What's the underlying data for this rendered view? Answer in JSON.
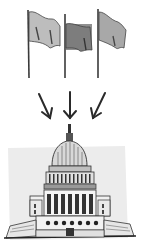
{
  "illustration": {
    "description": "Three flags with arrows pointing down to the U.S. Capitol building",
    "flags": [
      {
        "name": "flag-left",
        "x": 28,
        "shade": "#bdbdbd"
      },
      {
        "name": "flag-center",
        "x": 65,
        "shade": "#8a8a8a"
      },
      {
        "name": "flag-right",
        "x": 98,
        "shade": "#a8a8a8"
      }
    ],
    "arrows": [
      {
        "name": "arrow-left",
        "direction": "down-right"
      },
      {
        "name": "arrow-center",
        "direction": "down"
      },
      {
        "name": "arrow-right",
        "direction": "down-left"
      }
    ],
    "building": {
      "name": "capitol-building"
    },
    "colors": {
      "background": "#ffffff",
      "ink": "#2a2a2a",
      "sky_shade": "#ececec"
    }
  }
}
